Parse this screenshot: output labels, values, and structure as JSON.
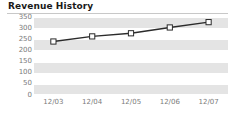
{
  "widget": {
    "title": "Revenue History"
  },
  "chart_data": {
    "type": "line",
    "title": "Revenue History",
    "xlabel": "",
    "ylabel": "",
    "categories": [
      "12/03",
      "12/04",
      "12/05",
      "12/06",
      "12/07"
    ],
    "values": [
      240,
      263,
      277,
      303,
      327
    ],
    "series": [
      {
        "name": "Revenue",
        "values": [
          240,
          263,
          277,
          303,
          327
        ]
      }
    ],
    "ylim": [
      0,
      350
    ],
    "yticks": [
      350,
      300,
      250,
      200,
      150,
      100,
      50,
      0
    ],
    "ytick_labels": [
      "350",
      "300",
      "250",
      "200",
      "150",
      "100",
      "50",
      "0"
    ],
    "xtick_labels": [
      "12/03",
      "12/04",
      "12/05",
      "12/06",
      "12/07"
    ],
    "grid": true,
    "grid_style": "horizontal-banded",
    "legend": false,
    "legend_position": "none",
    "marker": "open-square",
    "colors": {
      "line": "#2b2b2b",
      "marker_fill": "#ffffff",
      "marker_stroke": "#2b2b2b",
      "band": "#e4e4e4",
      "plot_background": "#ffffff",
      "tick_label": "#7b7b7b",
      "title": "#1a1a1a",
      "rule": "#c8c8c8"
    }
  }
}
